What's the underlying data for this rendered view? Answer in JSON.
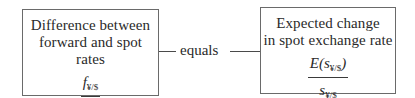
{
  "left_box": {
    "title_line1": "Difference between",
    "title_line2": "forward and spot rates",
    "numerator_var": "f",
    "numerator_sub": "¥/$",
    "denominator_var": "s",
    "denominator_sub": "¥/$"
  },
  "connector": {
    "label": "equals"
  },
  "right_box": {
    "title_line1": "Expected change",
    "title_line2": "in spot exchange rate",
    "numerator_prefix": "E(",
    "numerator_var": "s",
    "numerator_sub": "¥/$",
    "numerator_suffix": ")",
    "denominator_var": "s",
    "denominator_sub": "¥/$"
  }
}
